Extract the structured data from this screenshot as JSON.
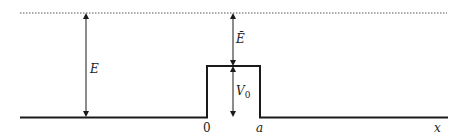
{
  "diagram": {
    "colors": {
      "line": "#1a1a1a",
      "dotted": "#555555",
      "background": "#ffffff"
    },
    "energy_level": {
      "style": "dotted"
    },
    "labels": {
      "total_energy": "E",
      "excess_energy": "Ē",
      "barrier_height_base": "V",
      "barrier_height_sub": "0",
      "origin": "0",
      "barrier_width": "a",
      "x_axis": "x"
    }
  }
}
